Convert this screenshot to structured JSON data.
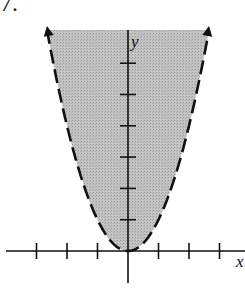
{
  "problem_number": "7.",
  "colors": {
    "shade": "#bdbdbd",
    "ink": "#111111",
    "background": "#ffffff"
  },
  "chart_data": {
    "type": "area",
    "title": "",
    "curve": "y = x^2",
    "inequality": "y > x^2",
    "boundary_style": "dashed",
    "shaded": "above curve",
    "xlabel": "x",
    "ylabel": "y",
    "x_ticks": [
      -3,
      -2,
      -1,
      1,
      2,
      3
    ],
    "y_ticks": [
      1,
      2,
      3,
      4,
      5,
      6
    ],
    "xlim": [
      -4,
      3.8
    ],
    "ylim": [
      -1,
      7.1
    ],
    "tick_labels_shown": false,
    "grid": false,
    "arrows": "curve ends have arrowheads at top"
  }
}
